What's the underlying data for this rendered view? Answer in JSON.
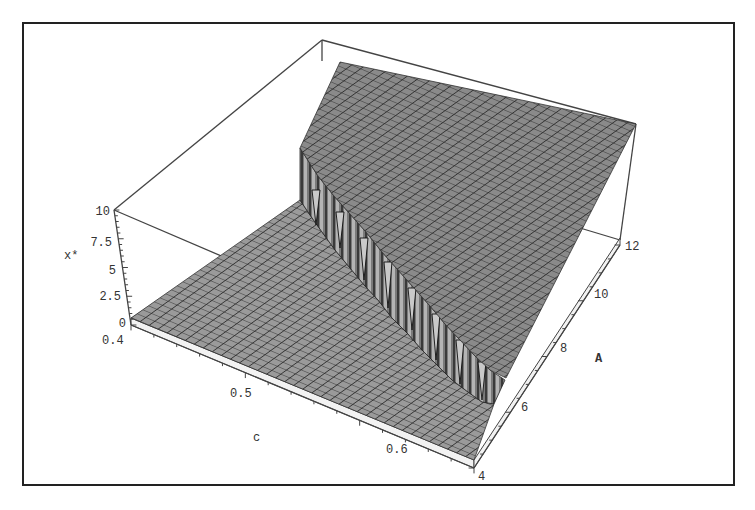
{
  "chart_data": {
    "type": "surface3d",
    "title": "",
    "xlabel": "c",
    "ylabel": "A",
    "zlabel": "x*",
    "x_ticks": [
      "0.4",
      "0.5",
      "0.6"
    ],
    "y_ticks": [
      "4",
      "6",
      "8",
      "10",
      "12"
    ],
    "z_ticks": [
      "0",
      "2.5",
      "5",
      "7.5",
      "10"
    ],
    "xlim": [
      0.4,
      0.7
    ],
    "ylim": [
      4,
      12
    ],
    "zlim": [
      0,
      10
    ],
    "grid": "mesh",
    "boundary_points": [
      {
        "c": 0.45,
        "A": 12,
        "jump_to": 8.5
      },
      {
        "c": 0.5,
        "A": 10.5,
        "jump_to": 7
      },
      {
        "c": 0.55,
        "A": 9,
        "jump_to": 5.5
      },
      {
        "c": 0.6,
        "A": 7.5,
        "jump_to": 4
      },
      {
        "c": 0.65,
        "A": 6,
        "jump_to": 2.5
      }
    ]
  },
  "axes": {
    "z_label": "x*",
    "x_label": "c",
    "y_label": "A",
    "z_ticks": [
      {
        "label": "10",
        "x": 103,
        "y": 215
      },
      {
        "label": "7.5",
        "x": 103,
        "y": 246
      },
      {
        "label": "5",
        "x": 103,
        "y": 274
      },
      {
        "label": "2.5",
        "x": 103,
        "y": 300
      },
      {
        "label": "0",
        "x": 103,
        "y": 327
      }
    ],
    "x_ticks": [
      {
        "label": "0.4",
        "x": 103,
        "y": 344
      },
      {
        "label": "0.5",
        "x": 230,
        "y": 397
      },
      {
        "label": "0.6",
        "x": 388,
        "y": 453
      }
    ],
    "y_ticks": [
      {
        "label": "4",
        "x": 480,
        "y": 480
      },
      {
        "label": "6",
        "x": 520,
        "y": 411
      },
      {
        "label": "8",
        "x": 560,
        "y": 353
      },
      {
        "label": "10",
        "x": 592,
        "y": 298
      },
      {
        "label": "12",
        "x": 624,
        "y": 250
      }
    ]
  },
  "colors": {
    "surface_fill": "#8d8d8d",
    "surface_grid": "#2a2a2a",
    "cliff_fill": "#6f6f6f",
    "box_line": "#444444",
    "frame": "#222222"
  }
}
